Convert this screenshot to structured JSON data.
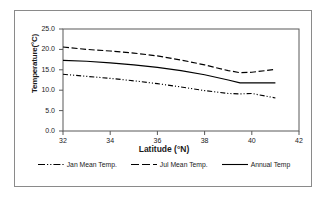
{
  "chart_data": {
    "type": "line",
    "title": "",
    "xlabel": "Latitude (°N)",
    "ylabel": "Temperature(°C)",
    "xlim": [
      32,
      42
    ],
    "ylim": [
      0.0,
      25.0
    ],
    "xticks": [
      "32",
      "34",
      "36",
      "38",
      "40",
      "42"
    ],
    "yticks": [
      "25.0",
      "20.0",
      "15.0",
      "10.0",
      "5.0",
      "0.0"
    ],
    "grid": false,
    "legend_position": "bottom",
    "x": [
      32,
      33,
      34,
      35,
      36,
      37,
      38,
      39,
      39.5,
      40,
      41
    ],
    "series": [
      {
        "name": "Jan Mean Temp.",
        "style": "dash-dot-dot",
        "color": "#000000",
        "values": [
          13.9,
          13.4,
          12.9,
          12.3,
          11.6,
          10.8,
          9.9,
          9.2,
          9.1,
          9.2,
          8.1
        ]
      },
      {
        "name": "Jul Mean Temp.",
        "style": "dashed",
        "color": "#000000",
        "values": [
          20.6,
          20.0,
          19.6,
          19.1,
          18.4,
          17.4,
          16.2,
          14.8,
          14.3,
          14.4,
          15.1
        ]
      },
      {
        "name": "Annual Temp",
        "style": "solid",
        "color": "#000000",
        "values": [
          17.3,
          17.1,
          16.7,
          16.2,
          15.6,
          14.8,
          13.8,
          12.5,
          11.8,
          11.8,
          11.8
        ]
      }
    ]
  },
  "legend": {
    "items": [
      {
        "label": "Jan Mean Temp."
      },
      {
        "label": "Jul Mean Temp."
      },
      {
        "label": "Annual Temp"
      }
    ]
  }
}
